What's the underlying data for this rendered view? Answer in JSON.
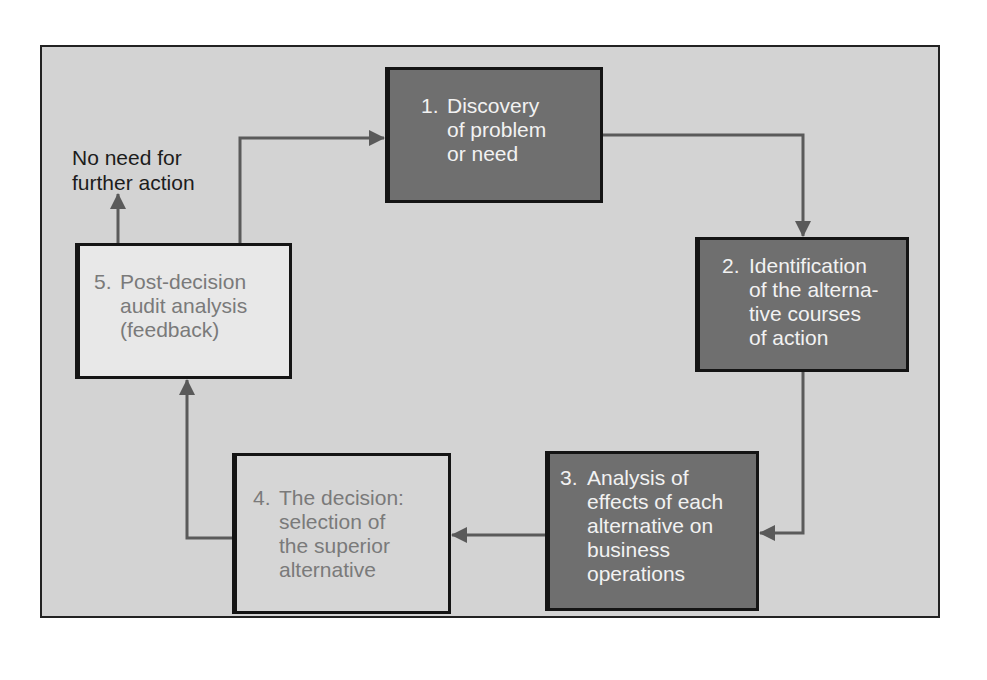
{
  "diagram": {
    "type": "cycle-flowchart",
    "colors": {
      "panel_background": "#d3d3d3",
      "dark_box": "#6f6f6f",
      "mid_box": "#d6d6d6",
      "light_box": "#e8e8e8",
      "arrow": "#5a5a5a",
      "border": "#141414"
    },
    "steps": [
      {
        "number": "1.",
        "lines": [
          "Discovery",
          "of problem",
          "or need"
        ],
        "shade": "dark"
      },
      {
        "number": "2.",
        "lines": [
          "Identification",
          "of the alterna-",
          "tive courses",
          "of action"
        ],
        "shade": "dark"
      },
      {
        "number": "3.",
        "lines": [
          "Analysis of",
          "effects of each",
          "alternative on",
          "business",
          "operations"
        ],
        "shade": "dark"
      },
      {
        "number": "4.",
        "lines": [
          "The decision:",
          "selection of",
          "the superior",
          "alternative"
        ],
        "shade": "mid"
      },
      {
        "number": "5.",
        "lines": [
          "Post-decision",
          "audit analysis",
          "(feedback)"
        ],
        "shade": "light"
      }
    ],
    "exit_label": {
      "lines": [
        "No need for",
        "further action"
      ]
    },
    "connections": [
      {
        "from": "1",
        "to": "2"
      },
      {
        "from": "2",
        "to": "3"
      },
      {
        "from": "3",
        "to": "4"
      },
      {
        "from": "4",
        "to": "5"
      },
      {
        "from": "5",
        "to": "1"
      },
      {
        "from": "5",
        "to": "exit"
      }
    ]
  }
}
